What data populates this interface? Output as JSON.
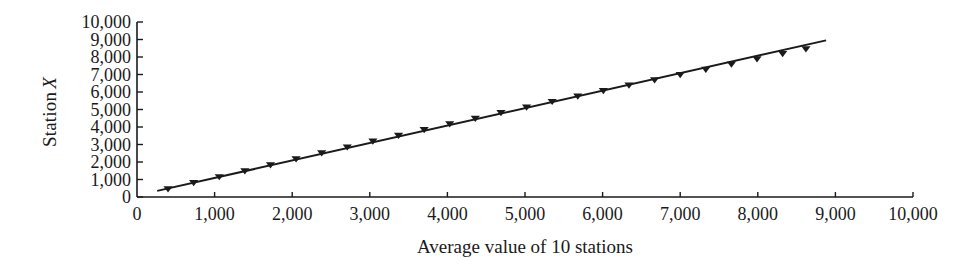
{
  "chart_data": {
    "type": "scatter",
    "title": "",
    "xlabel": "Average value of 10 stations",
    "ylabel": "Station X",
    "ylabel_italic_suffix": "X",
    "ylabel_prefix": "Station",
    "xlim": [
      0,
      10000
    ],
    "ylim": [
      0,
      10000
    ],
    "grid": false,
    "legend": null,
    "marker": "filled-down-triangle",
    "marker_color": "#1a1a1a",
    "line_color": "#1a1a1a",
    "xticks": [
      0,
      1000,
      2000,
      3000,
      4000,
      5000,
      6000,
      7000,
      8000,
      9000,
      10000
    ],
    "xtick_labels": [
      "0",
      "1,000",
      "2,000",
      "3,000",
      "4,000",
      "5,000",
      "6,000",
      "7,000",
      "8,000",
      "9,000",
      "10,000"
    ],
    "yticks": [
      0,
      1000,
      2000,
      3000,
      4000,
      5000,
      6000,
      7000,
      8000,
      9000,
      10000
    ],
    "ytick_labels": [
      "0",
      "1,000",
      "2,000",
      "3,000",
      "4,000",
      "5,000",
      "6,000",
      "7,000",
      "8,000",
      "9,000",
      "10,000"
    ],
    "series": [
      {
        "name": "Station X vs average of 10 stations",
        "x": [
          400,
          730,
          1060,
          1390,
          1720,
          2050,
          2380,
          2710,
          3040,
          3370,
          3700,
          4030,
          4360,
          4690,
          5020,
          5350,
          5680,
          6010,
          6340,
          6670,
          7000,
          7330,
          7660,
          7990,
          8320,
          8620
        ],
        "y": [
          440,
          790,
          1130,
          1470,
          1810,
          2150,
          2490,
          2830,
          3160,
          3490,
          3820,
          4150,
          4470,
          4790,
          5110,
          5430,
          5740,
          6050,
          6360,
          6670,
          6970,
          7270,
          7570,
          7870,
          8170,
          8440
        ]
      }
    ],
    "trend_line": {
      "name": "fitted line",
      "x": [
        260,
        8880
      ],
      "y": [
        350,
        8950
      ]
    }
  }
}
